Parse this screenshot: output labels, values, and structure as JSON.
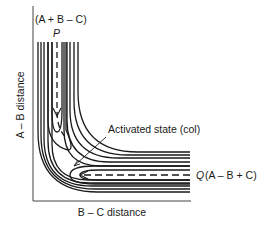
{
  "diagram": {
    "type": "potential-energy-surface-contour",
    "y_axis_label": "A – B distance",
    "x_axis_label": "B – C distance",
    "reactant_point": {
      "letter": "P",
      "species": "(A + B – C)"
    },
    "product_point": {
      "letter": "Q",
      "species": "(A – B + C)"
    },
    "saddle_label": "Activated state (col)",
    "reaction_path": "dashed line from P down the valley, around the corner through the col, to Q",
    "contour_count_per_side": 5,
    "colors": {
      "line": "#1a1a1a",
      "background": "#ffffff"
    }
  }
}
